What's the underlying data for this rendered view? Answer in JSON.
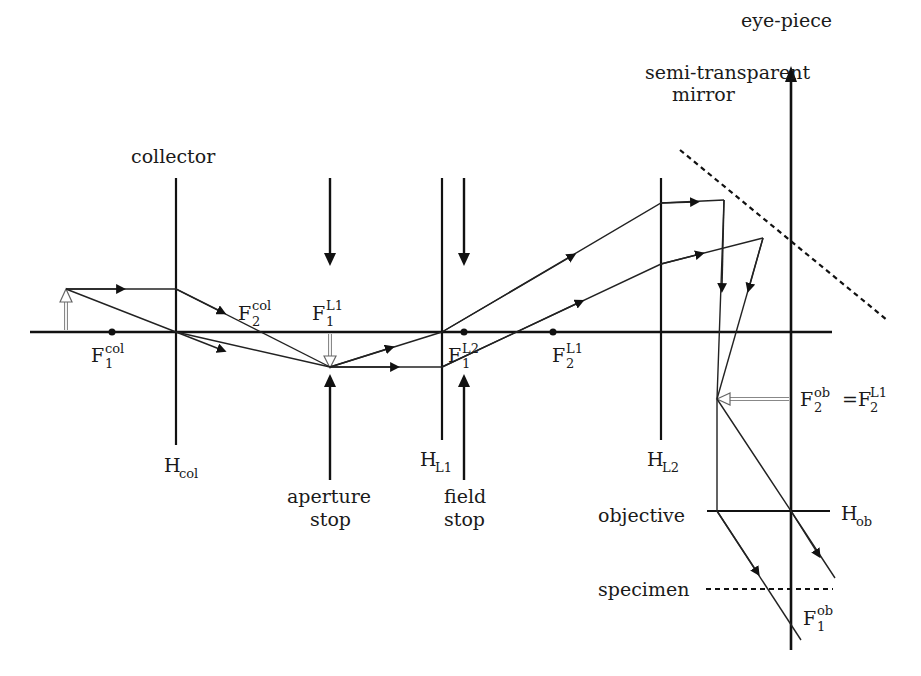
{
  "diagram": {
    "type": "optical-ray-diagram",
    "labels": {
      "eyepiece": "eye-piece",
      "mirror_line1": "semi-transparent",
      "mirror_line2": "mirror",
      "collector": "collector",
      "h_col": {
        "base": "H",
        "sub": "col"
      },
      "h_l1": {
        "base": "H",
        "sub": "L1"
      },
      "h_l2": {
        "base": "H",
        "sub": "L2"
      },
      "h_ob": {
        "base": "H",
        "sub": "ob"
      },
      "f1_col": {
        "base": "F",
        "sub": "1",
        "sup": "col"
      },
      "f2_col": {
        "base": "F",
        "sub": "2",
        "sup": "col"
      },
      "f1_l1": {
        "base": "F",
        "sub": "1",
        "sup": "L1"
      },
      "f1_l2": {
        "base": "F",
        "sub": "1",
        "sup": "L2"
      },
      "f2_l1": {
        "base": "F",
        "sub": "2",
        "sup": "L1"
      },
      "f2_ob": {
        "base": "F",
        "sub": "2",
        "sup": "ob"
      },
      "f2_ob_eq": {
        "prefix": "=F",
        "sub": "2",
        "sup": "L1"
      },
      "f1_ob": {
        "base": "F",
        "sub": "1",
        "sup": "ob"
      },
      "aperture_line1": "aperture",
      "aperture_line2": "stop",
      "field_line1": "field",
      "field_line2": "stop",
      "objective": "objective",
      "specimen": "specimen"
    },
    "colors": {
      "line": "#111111",
      "image_arrow_fill": "#ffffff",
      "image_arrow_stroke": "#888888"
    }
  }
}
